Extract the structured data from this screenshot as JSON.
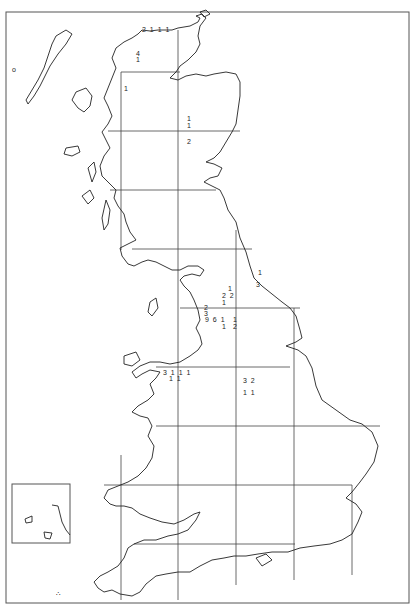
{
  "map": {
    "title": "Distribution map of Great Britain (10 km / 100 km grid)",
    "colors": {
      "background": "#ffffff",
      "coast": "#222222",
      "grid": "#444444",
      "frame": "#555555"
    },
    "frame": {
      "x": 6,
      "y": 12,
      "w": 403,
      "h": 591
    },
    "grid_x": [
      121,
      178,
      236,
      294,
      352
    ],
    "grid_y": [
      72,
      131,
      190,
      249,
      308,
      367,
      426,
      485,
      544
    ],
    "inset": {
      "x": 12,
      "y": 484,
      "w": 58,
      "h": 59,
      "label": "Channel Islands inset"
    },
    "counts": [
      {
        "id": "sutherland-n",
        "x": 142,
        "y": 30,
        "text": "2 1 1 1"
      },
      {
        "id": "sutherland-a",
        "x": 136,
        "y": 54,
        "text": "4"
      },
      {
        "id": "sutherland-b",
        "x": 136,
        "y": 60,
        "text": "1"
      },
      {
        "id": "ross-w",
        "x": 124,
        "y": 89,
        "text": "1"
      },
      {
        "id": "grampian-a",
        "x": 187,
        "y": 119,
        "text": "1"
      },
      {
        "id": "grampian-b",
        "x": 187,
        "y": 126,
        "text": "1"
      },
      {
        "id": "grampian-c",
        "x": 187,
        "y": 142,
        "text": "2"
      },
      {
        "id": "durham-a",
        "x": 258,
        "y": 273,
        "text": "1"
      },
      {
        "id": "durham-b",
        "x": 256,
        "y": 285,
        "text": "3"
      },
      {
        "id": "pennines-a",
        "x": 228,
        "y": 289,
        "text": "1"
      },
      {
        "id": "pennines-b",
        "x": 222,
        "y": 296,
        "text": "2 2"
      },
      {
        "id": "pennines-c",
        "x": 222,
        "y": 303,
        "text": "1"
      },
      {
        "id": "lancs-a",
        "x": 204,
        "y": 308,
        "text": "2"
      },
      {
        "id": "lancs-b",
        "x": 204,
        "y": 314,
        "text": "3"
      },
      {
        "id": "lancs-c",
        "x": 205,
        "y": 320,
        "text": "9 6 1"
      },
      {
        "id": "lancs-d",
        "x": 222,
        "y": 327,
        "text": "1"
      },
      {
        "id": "yorks-a",
        "x": 233,
        "y": 320,
        "text": "1"
      },
      {
        "id": "yorks-b",
        "x": 233,
        "y": 327,
        "text": "2"
      },
      {
        "id": "wales-n-a",
        "x": 163,
        "y": 373,
        "text": "3 1 1 1"
      },
      {
        "id": "wales-n-b",
        "x": 169,
        "y": 379,
        "text": "1 1"
      },
      {
        "id": "midlands-a",
        "x": 243,
        "y": 381,
        "text": "3 2"
      },
      {
        "id": "midlands-b",
        "x": 243,
        "y": 393,
        "text": "1 1"
      }
    ],
    "symbols": [
      {
        "id": "rockall-marker",
        "x": 12,
        "y": 70,
        "text": "o"
      },
      {
        "id": "scilly-marker",
        "x": 56,
        "y": 594,
        "text": "∴"
      }
    ]
  }
}
